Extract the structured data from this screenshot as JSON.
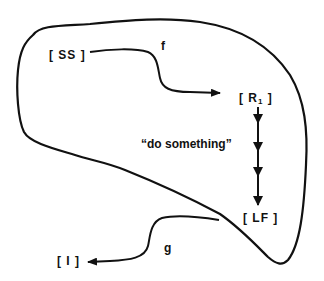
{
  "diagram": {
    "type": "state-transition",
    "colors": {
      "stroke": "#111111",
      "background": "#ffffff",
      "text": "#111111"
    },
    "nodes": {
      "ss": {
        "label": "[ SS ]"
      },
      "r1": {
        "open": "[ R",
        "sub": "1",
        "close": " ]"
      },
      "lf": {
        "label": "[ LF ]"
      },
      "i": {
        "label": "[ I ]"
      }
    },
    "edges": {
      "f": {
        "label": "f",
        "from": "[ SS ]",
        "to": "[ R1 ]"
      },
      "g": {
        "label": "g",
        "from": "[ LF ]",
        "to": "[ I ]"
      }
    },
    "action": {
      "label": "“do something”",
      "from": "[ R1 ]",
      "to": "[ LF ]",
      "steps": 4
    }
  }
}
